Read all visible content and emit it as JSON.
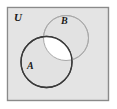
{
  "figure": {
    "name": "venn-diagram-two-sets",
    "type": "venn"
  },
  "universal_set": {
    "label": "U",
    "shape": "rectangle",
    "fill_color": "#e2e2e2",
    "border_color": "#8a8a8a",
    "x": 7,
    "y": 7,
    "width": 101,
    "height": 93
  },
  "sets": [
    {
      "id": "A",
      "label": "A",
      "shape": "circle",
      "cx": 46.5,
      "cy": 62,
      "r": 25.5,
      "stroke_color": "#3a3a3a",
      "stroke_width": 1.3,
      "fill_color": "#e2e2e2",
      "label_x": 27,
      "label_y": 69
    },
    {
      "id": "B",
      "label": "B",
      "shape": "circle",
      "cx": 66,
      "cy": 38,
      "r": 22.5,
      "stroke_color": "#a8a8a8",
      "stroke_width": 1.0,
      "fill_color": "#e2e2e2",
      "label_x": 61,
      "label_y": 24
    }
  ],
  "intersection": {
    "label": "",
    "region": "A and B",
    "fill_color": "#ffffff",
    "shaded": true
  },
  "colors": {
    "page_background": "#ffffff",
    "universe_fill": "#e2e2e2",
    "universe_border": "#8a8a8a",
    "circle_a_stroke": "#3a3a3a",
    "circle_b_stroke": "#a8a8a8",
    "intersection_fill": "#ffffff",
    "label_color": "#1a1a1a"
  }
}
